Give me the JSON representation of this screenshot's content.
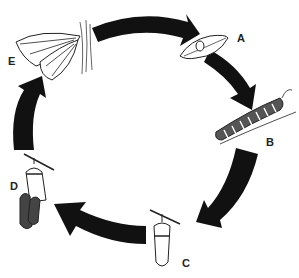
{
  "diagram": {
    "title": "",
    "type": "life-cycle",
    "colors": {
      "arrow": "#111111",
      "outline": "#222222",
      "background": "#ffffff"
    },
    "stages": [
      {
        "label": "A",
        "illustration": "egg-on-leaf"
      },
      {
        "label": "B",
        "illustration": "caterpillar"
      },
      {
        "label": "C",
        "illustration": "chrysalis"
      },
      {
        "label": "D",
        "illustration": "butterfly-emerging"
      },
      {
        "label": "E",
        "illustration": "adult-butterfly"
      }
    ]
  }
}
